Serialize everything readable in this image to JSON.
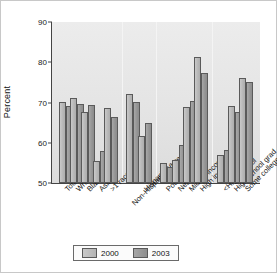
{
  "chart_data": {
    "type": "bar",
    "title": "",
    "xlabel": "",
    "ylabel": "Percent",
    "ylim": [
      50,
      90
    ],
    "yticks": [
      50,
      60,
      70,
      80,
      90
    ],
    "grid": false,
    "legend_position": "bottom",
    "categories": [
      "Total",
      "White",
      "Black",
      "Asian",
      ">1 race",
      "Non-Hispanic White",
      "Hispanic",
      "Poor",
      "Near poor",
      "Middle income",
      "High income",
      "<High school",
      "High school grad",
      "Some college"
    ],
    "group_breaks_after": [
      "&gt;1 race",
      "Hispanic",
      "High income"
    ],
    "series": [
      {
        "name": "2000",
        "values": [
          70.2,
          71.1,
          67.6,
          55.5,
          68.7,
          72.0,
          61.7,
          55.0,
          55.8,
          69.0,
          81.4,
          57.0,
          69.1,
          76.1
        ]
      },
      {
        "name": "2003",
        "values": [
          69.2,
          69.7,
          69.5,
          58.0,
          66.4,
          70.2,
          65.0,
          54.1,
          59.4,
          70.4,
          77.4,
          58.2,
          67.7,
          75.1
        ]
      }
    ]
  },
  "axis": {
    "y_label": "Percent",
    "y_ticks": [
      "50",
      "60",
      "70",
      "80",
      "90"
    ]
  },
  "legend": {
    "items": [
      {
        "label": "2000"
      },
      {
        "label": "2003"
      }
    ]
  },
  "xlabels": [
    {
      "text": "Total"
    },
    {
      "text": "White"
    },
    {
      "text": "Black"
    },
    {
      "text": "Asian"
    },
    {
      "text": ">1 race"
    },
    {
      "text": "Non-Hispanic White"
    },
    {
      "text": "Hispanic"
    },
    {
      "text": "Poor"
    },
    {
      "text": "Near poor"
    },
    {
      "text": "Middle income"
    },
    {
      "text": "High income"
    },
    {
      "text": "<High school"
    },
    {
      "text": "High school grad"
    },
    {
      "text": "Some college"
    }
  ],
  "colors": {
    "series_2000": "#b8b8b8",
    "series_2003": "#949494",
    "plot_background": "#e6e6e6",
    "axis": "#444444",
    "separator": "#f4f4f4"
  }
}
